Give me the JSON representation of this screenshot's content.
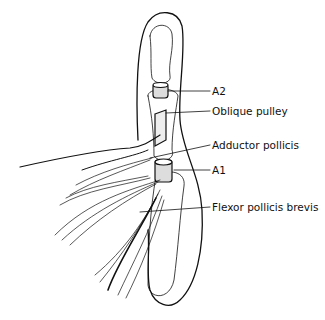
{
  "diagram": {
    "labels": [
      {
        "id": "a2",
        "text": "A2",
        "x": 212,
        "y": 85
      },
      {
        "id": "oblique",
        "text": "Oblique pulley",
        "x": 212,
        "y": 105
      },
      {
        "id": "adductor",
        "text": "Adductor pollicis",
        "x": 212,
        "y": 140
      },
      {
        "id": "a1",
        "text": "A1",
        "x": 212,
        "y": 164
      },
      {
        "id": "fpb",
        "text": "Flexor pollicis brevis",
        "x": 212,
        "y": 201
      }
    ],
    "colors": {
      "ink": "#111111",
      "background": "#ffffff"
    }
  }
}
